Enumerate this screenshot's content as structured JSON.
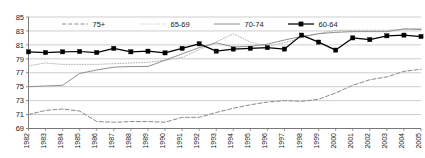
{
  "chart_data": {
    "type": "line",
    "title": "",
    "subtitle": "",
    "xlabel": "",
    "ylabel": "",
    "grid": true,
    "legend_position": "top-inside",
    "categories": [
      "1982",
      "1983",
      "1984",
      "1985",
      "1986",
      "1987",
      "1988",
      "1989",
      "1990",
      "1991",
      "1992",
      "1993",
      "1994",
      "1995",
      "1996",
      "1997",
      "1998",
      "1999",
      "2000",
      "2001",
      "2002",
      "2003",
      "2004",
      "2005"
    ],
    "x": [
      1982,
      1983,
      1984,
      1985,
      1986,
      1987,
      1988,
      1989,
      1990,
      1991,
      1992,
      1993,
      1994,
      1995,
      1996,
      1997,
      1998,
      1999,
      2000,
      2001,
      2002,
      2003,
      2004,
      2005
    ],
    "xlim": [
      1982,
      2005
    ],
    "ylim": [
      69,
      85
    ],
    "ytick_values": [
      69,
      71,
      73,
      75,
      77,
      79,
      81,
      83,
      85
    ],
    "ytick_labels": [
      "69",
      "71",
      "73",
      "75",
      "77",
      "79",
      "81",
      "83",
      "85"
    ],
    "series": [
      {
        "name": "75+",
        "style": "dashed",
        "marker": "none",
        "color": "#8a8a8a",
        "values": [
          71.0,
          71.6,
          71.8,
          71.5,
          70.0,
          69.9,
          70.0,
          70.0,
          69.9,
          70.6,
          70.6,
          71.3,
          71.9,
          72.4,
          72.8,
          73.0,
          72.9,
          73.2,
          74.1,
          75.2,
          76.0,
          76.4,
          77.2,
          77.5
        ]
      },
      {
        "name": "65-69",
        "style": "dotted",
        "marker": "none",
        "color": "#b5b5b5",
        "values": [
          78.0,
          78.4,
          78.2,
          78.2,
          78.2,
          78.3,
          78.4,
          78.5,
          78.8,
          79.2,
          80.3,
          81.4,
          82.6,
          81.4,
          80.8,
          81.3,
          82.0,
          82.6,
          83.1,
          83.1,
          83.1,
          83.1,
          83.2,
          83.4
        ]
      },
      {
        "name": "70-74",
        "style": "solid",
        "marker": "none",
        "color": "#8f8f8f",
        "values": [
          75.0,
          75.1,
          75.2,
          76.9,
          77.4,
          77.8,
          77.9,
          77.9,
          78.8,
          79.7,
          80.6,
          81.3,
          80.7,
          80.8,
          81.1,
          81.7,
          82.2,
          82.6,
          82.8,
          82.9,
          82.9,
          82.9,
          83.3,
          83.2
        ]
      },
      {
        "name": "60-64",
        "style": "solid",
        "marker": "square",
        "color": "#000000",
        "values": [
          80.0,
          79.9,
          80.0,
          80.05,
          79.9,
          80.5,
          80.0,
          80.1,
          79.85,
          80.5,
          81.15,
          80.1,
          80.4,
          80.5,
          80.6,
          80.4,
          82.4,
          81.4,
          80.25,
          82.0,
          81.75,
          82.3,
          82.4,
          82.2
        ]
      }
    ],
    "legend": [
      {
        "label": "75+",
        "style": "dashed",
        "marker": "none"
      },
      {
        "label": "65-69",
        "style": "dotted",
        "marker": "none"
      },
      {
        "label": "70-74",
        "style": "solid",
        "marker": "none"
      },
      {
        "label": "60-64",
        "style": "solid",
        "marker": "square"
      }
    ],
    "colors": {
      "grid": "#b9b9b9",
      "axis": "#6e6e6e",
      "plot_background": "#ffffff",
      "series_75plus": "#8a8a8a",
      "series_65_69": "#b5b5b5",
      "series_70_74": "#8f8f8f",
      "series_60_64": "#000000"
    }
  }
}
